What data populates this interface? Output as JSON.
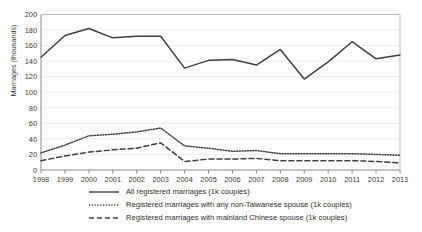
{
  "chart_data": {
    "type": "line",
    "title": "",
    "xlabel": "",
    "ylabel": "Marriages (thousands)",
    "ylim": [
      0,
      200
    ],
    "ytick_step": 20,
    "grid": true,
    "legend_position": "bottom",
    "categories": [
      "1998",
      "1999",
      "2000",
      "2001",
      "2002",
      "2003",
      "2004",
      "2005",
      "2006",
      "2007",
      "2008",
      "2009",
      "2010",
      "2011",
      "2012",
      "2013"
    ],
    "yticks": [
      "0",
      "20",
      "40",
      "60",
      "80",
      "100",
      "120",
      "140",
      "160",
      "180",
      "200"
    ],
    "series": [
      {
        "name": "All registered marriages (1k couples)",
        "style": "solid",
        "color": "#404040",
        "values": [
          145,
          173,
          182,
          170,
          172,
          172,
          131,
          141,
          142,
          135,
          155,
          117,
          139,
          165,
          143,
          148
        ]
      },
      {
        "name": "Registered marriages with any non-Taiwanese spouse (1k couples)",
        "style": "dotted",
        "color": "#404040",
        "values": [
          22,
          32,
          44,
          46,
          49,
          54,
          31,
          28,
          24,
          25,
          21,
          21,
          21,
          21,
          20,
          19
        ]
      },
      {
        "name": "Registered marriages with mainland Chinese spouse (1k couples)",
        "style": "dashed",
        "color": "#404040",
        "values": [
          12,
          18,
          23,
          26,
          28,
          35,
          11,
          14,
          14,
          15,
          12,
          12,
          12,
          12,
          11,
          9
        ]
      }
    ]
  },
  "axes": {
    "ylabel": "Marriages (thousands)"
  },
  "legend": {
    "items": [
      {
        "label": "All registered marriages (1k couples)",
        "style": "solid"
      },
      {
        "label": "Registered marriages with any non-Taiwanese spouse (1k couples)",
        "style": "dotted"
      },
      {
        "label": "Registered marriages with mainland Chinese spouse (1k couples)",
        "style": "dashed"
      }
    ]
  },
  "colors": {
    "line": "#404040",
    "grid": "#ececec",
    "axis": "#8a8a8a",
    "text": "#333333"
  }
}
